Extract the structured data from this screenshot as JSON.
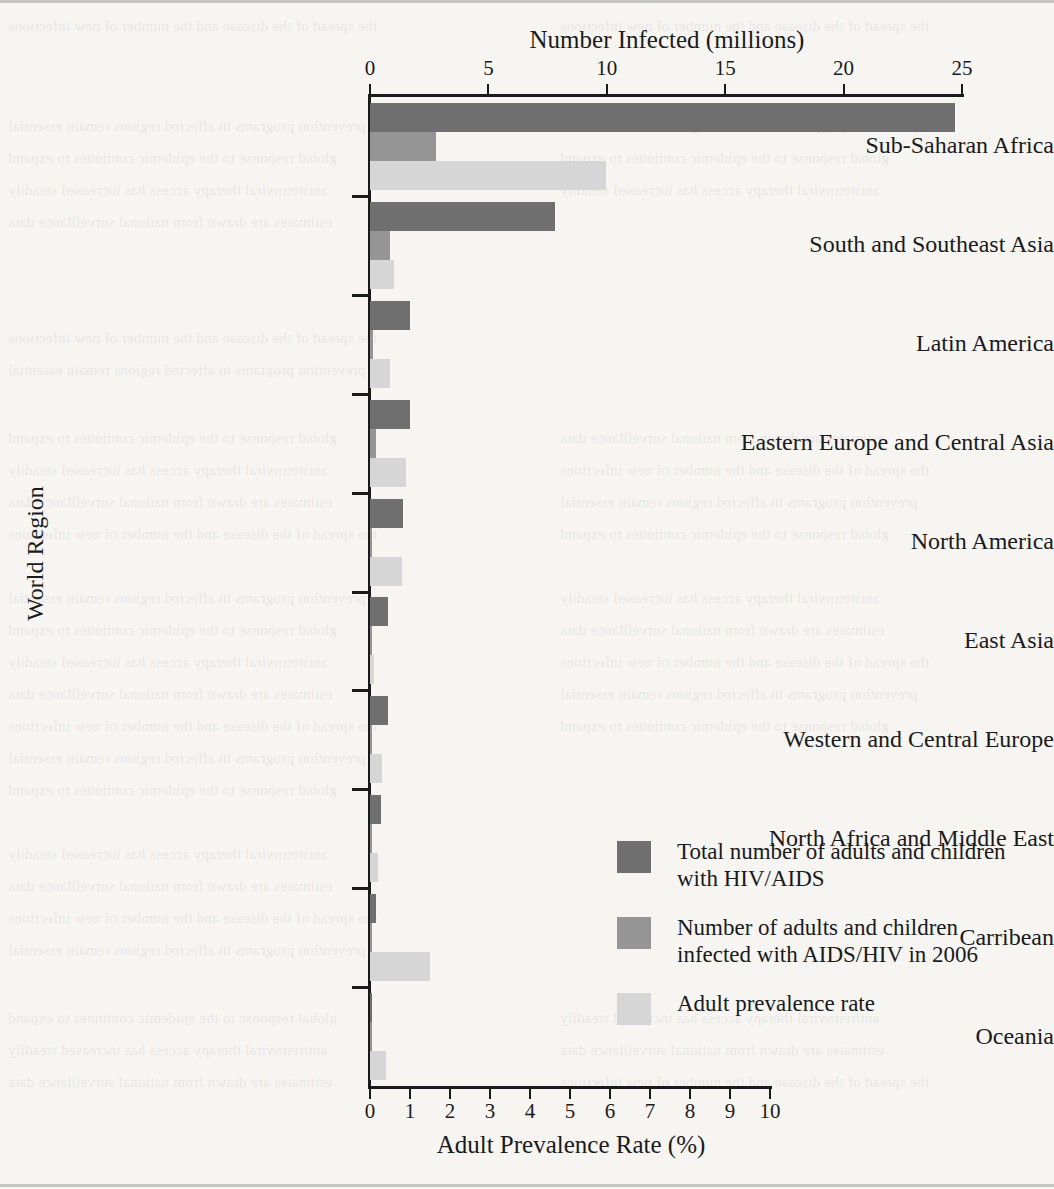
{
  "figure": {
    "top_axis_title": "Number Infected (millions)",
    "bottom_axis_title": "Adult Prevalence Rate (%)",
    "y_axis_title": "World Region"
  },
  "legend": {
    "items": [
      {
        "label": "Total number of adults and children with HIV/AIDS",
        "color": "#6f6f6f",
        "swatch_name": "legend-swatch-total"
      },
      {
        "label": "Number of adults and children infected with AIDS/HIV in 2006",
        "color": "#959595",
        "swatch_name": "legend-swatch-new-2006"
      },
      {
        "label": "Adult prevalence rate",
        "color": "#d6d6d6",
        "swatch_name": "legend-swatch-prevalence"
      }
    ]
  },
  "chart_data": {
    "type": "bar",
    "orientation": "horizontal",
    "title": "",
    "xlabel": "Number Infected (millions)",
    "xlabel_secondary": "Adult Prevalence Rate (%)",
    "ylabel": "World Region",
    "grid": false,
    "legend_position": "inside-bottom-right",
    "top_axis": {
      "title": "Number Infected (millions)",
      "ticks": [
        0,
        5,
        10,
        15,
        20,
        25
      ],
      "tick_labels": [
        "0",
        "5",
        "10",
        "15",
        "20",
        "25"
      ],
      "lim": [
        0,
        25
      ]
    },
    "bottom_axis": {
      "title": "Adult Prevalence Rate (%)",
      "ticks": [
        0,
        1,
        2,
        3,
        4,
        5,
        6,
        7,
        8,
        9,
        10
      ],
      "tick_labels": [
        "0",
        "1",
        "2",
        "3",
        "4",
        "5",
        "6",
        "7",
        "8",
        "9",
        "10"
      ],
      "lim": [
        0,
        10
      ]
    },
    "categories": [
      "Sub-Saharan Africa",
      "South and Southeast Asia",
      "Latin America",
      "Eastern Europe and Central Asia",
      "North America",
      "East Asia",
      "Western and Central Europe",
      "North  Africa and Middle East",
      "Carribean",
      "Oceania"
    ],
    "series": [
      {
        "name": "Total number of adults and children with HIV/AIDS",
        "unit": "millions",
        "axis": "top",
        "color": "#6f6f6f",
        "values": [
          24.7,
          7.8,
          1.7,
          1.7,
          1.4,
          0.75,
          0.74,
          0.46,
          0.25,
          0.081
        ]
      },
      {
        "name": "Number of adults and children infected with AIDS/HIV in 2006",
        "unit": "millions",
        "axis": "top",
        "color": "#959595",
        "values": [
          2.8,
          0.86,
          0.14,
          0.27,
          0.043,
          0.1,
          0.022,
          0.068,
          0.027,
          0.007
        ]
      },
      {
        "name": "Adult prevalence rate",
        "unit": "percent",
        "axis": "bottom",
        "color": "#d6d6d6",
        "values": [
          5.9,
          0.6,
          0.5,
          0.9,
          0.8,
          0.1,
          0.3,
          0.2,
          1.5,
          0.4
        ]
      }
    ]
  }
}
